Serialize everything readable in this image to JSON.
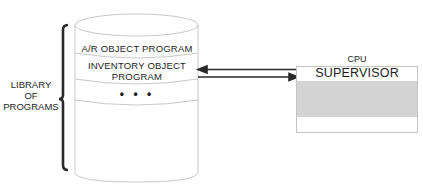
{
  "diagram": {
    "library_label": [
      "LIBRARY",
      "OF",
      "PROGRAMS"
    ],
    "storage": {
      "shape": "cylinder",
      "sections": [
        {
          "label": "A/R OBJECT PROGRAM"
        },
        {
          "label": "INVENTORY OBJECT PROGRAM",
          "lines": [
            "INVENTORY OBJECT",
            "PROGRAM"
          ]
        },
        {
          "label": "• • •"
        }
      ]
    },
    "cpu": {
      "title": "CPU",
      "supervisor_label": "SUPERVISOR",
      "shaded_region_color": "#d3d3d3"
    },
    "connections": [
      {
        "from": "cpu",
        "to": "inventory-object-program",
        "direction": "left"
      },
      {
        "from": "inventory-object-program",
        "to": "cpu",
        "direction": "right"
      }
    ]
  }
}
